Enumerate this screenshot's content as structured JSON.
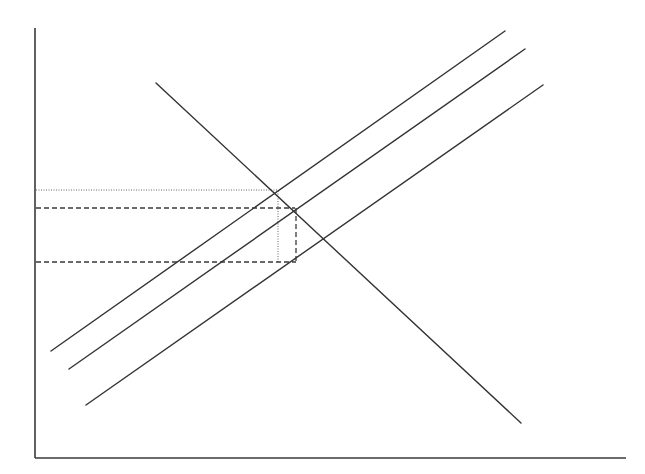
{
  "diagram": {
    "type": "supply-demand",
    "labels": [],
    "axes": {
      "y_axis": {
        "x1": 35,
        "y1": 28,
        "x2": 35,
        "y2": 458
      },
      "x_axis": {
        "x1": 35,
        "y1": 458,
        "x2": 626,
        "y2": 458
      }
    },
    "curves": [
      {
        "id": "demand",
        "x1": 156,
        "y1": 83,
        "x2": 521,
        "y2": 423
      },
      {
        "id": "supply-1",
        "x1": 51,
        "y1": 351,
        "x2": 505,
        "y2": 31
      },
      {
        "id": "supply-2",
        "x1": 69,
        "y1": 369,
        "x2": 525,
        "y2": 49
      },
      {
        "id": "supply-3",
        "x1": 86,
        "y1": 405,
        "x2": 543,
        "y2": 85
      }
    ],
    "reference_lines": {
      "dotted": [
        {
          "id": "price-1-dotted",
          "x1": 36,
          "y1": 190,
          "x2": 277,
          "y2": 190
        },
        {
          "id": "quantity-1-dotted",
          "x1": 278,
          "y1": 191,
          "x2": 278,
          "y2": 263
        }
      ],
      "dashed": [
        {
          "id": "price-2-dashed",
          "x1": 36,
          "y1": 208,
          "x2": 295,
          "y2": 208
        },
        {
          "id": "price-3-dashed",
          "x1": 36,
          "y1": 262,
          "x2": 296,
          "y2": 262
        },
        {
          "id": "quantity-2-dashed",
          "x1": 296,
          "y1": 208,
          "x2": 296,
          "y2": 262
        }
      ]
    },
    "colors": {
      "background": "#ffffff",
      "line": "#333333",
      "dotted": "#666666"
    }
  }
}
